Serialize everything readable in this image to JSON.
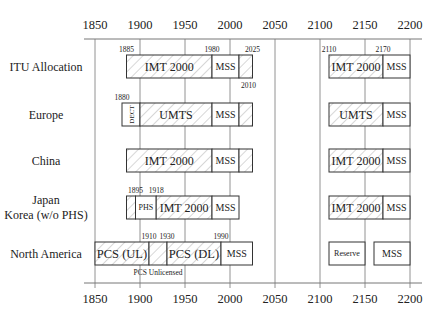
{
  "chart_data": {
    "type": "frequency-allocation-diagram",
    "title": "",
    "xlabel": "Frequency (MHz)",
    "xlim": [
      1850,
      2200
    ],
    "x_ticks": [
      1850,
      1900,
      1950,
      2000,
      2050,
      2100,
      2150,
      2200
    ],
    "grid": true,
    "rows": [
      {
        "label": [
          "ITU Allocation"
        ],
        "segments": [
          {
            "start": 1885,
            "end": 1980,
            "label": "IMT 2000",
            "hatched": true
          },
          {
            "start": 1980,
            "end": 2010,
            "label": "MSS",
            "hatched": false
          },
          {
            "start": 2010,
            "end": 2025,
            "label": "",
            "hatched": true
          },
          {
            "start": 2110,
            "end": 2170,
            "label": "IMT 2000",
            "hatched": true
          },
          {
            "start": 2170,
            "end": 2200,
            "label": "MSS",
            "hatched": false
          }
        ],
        "annotations_above": [
          {
            "value": 1885,
            "text": "1885"
          },
          {
            "value": 1980,
            "text": "1980"
          },
          {
            "value": 2025,
            "text": "2025"
          },
          {
            "value": 2110,
            "text": "2110"
          },
          {
            "value": 2170,
            "text": "2170"
          }
        ],
        "annotations_below": [
          {
            "value": 2010,
            "text": "2010"
          }
        ]
      },
      {
        "label": [
          "Europe"
        ],
        "segments": [
          {
            "start": 1880,
            "end": 1900,
            "label": "DECT",
            "hatched": false,
            "vertical": true
          },
          {
            "start": 1900,
            "end": 1980,
            "label": "UMTS",
            "hatched": true
          },
          {
            "start": 1980,
            "end": 2010,
            "label": "MSS",
            "hatched": false
          },
          {
            "start": 2010,
            "end": 2025,
            "label": "",
            "hatched": true
          },
          {
            "start": 2110,
            "end": 2170,
            "label": "UMTS",
            "hatched": true
          },
          {
            "start": 2170,
            "end": 2200,
            "label": "MSS",
            "hatched": false
          }
        ],
        "annotations_above": [
          {
            "value": 1880,
            "text": "1880"
          }
        ],
        "annotations_below": []
      },
      {
        "label": [
          "China"
        ],
        "segments": [
          {
            "start": 1885,
            "end": 1980,
            "label": "IMT 2000",
            "hatched": true
          },
          {
            "start": 1980,
            "end": 2010,
            "label": "MSS",
            "hatched": false
          },
          {
            "start": 2010,
            "end": 2025,
            "label": "",
            "hatched": true
          },
          {
            "start": 2110,
            "end": 2170,
            "label": "IMT 2000",
            "hatched": true
          },
          {
            "start": 2170,
            "end": 2200,
            "label": "MSS",
            "hatched": false
          }
        ],
        "annotations_above": [],
        "annotations_below": []
      },
      {
        "label": [
          "Japan",
          "Korea (w/o PHS)"
        ],
        "segments": [
          {
            "start": 1885,
            "end": 1895,
            "label": "",
            "hatched": true
          },
          {
            "start": 1895,
            "end": 1918,
            "label": "PHS",
            "hatched": false,
            "small": true
          },
          {
            "start": 1918,
            "end": 1980,
            "label": "IMT 2000",
            "hatched": true
          },
          {
            "start": 1980,
            "end": 2010,
            "label": "MSS",
            "hatched": false
          },
          {
            "start": 2110,
            "end": 2170,
            "label": "IMT 2000",
            "hatched": true
          },
          {
            "start": 2170,
            "end": 2200,
            "label": "MSS",
            "hatched": false
          }
        ],
        "annotations_above": [
          {
            "value": 1895,
            "text": "1895"
          },
          {
            "value": 1918,
            "text": "1918"
          }
        ],
        "annotations_below": []
      },
      {
        "label": [
          "North America"
        ],
        "segments": [
          {
            "start": 1850,
            "end": 1910,
            "label": "PCS (UL)",
            "hatched": true,
            "large": true
          },
          {
            "start": 1910,
            "end": 1930,
            "label": "",
            "hatched": true
          },
          {
            "start": 1930,
            "end": 1990,
            "label": "PCS (DL)",
            "hatched": true,
            "large": true
          },
          {
            "start": 1990,
            "end": 2025,
            "label": "MSS",
            "hatched": false
          },
          {
            "start": 2110,
            "end": 2150,
            "label": "Reserve",
            "hatched": false,
            "small": true
          },
          {
            "start": 2160,
            "end": 2200,
            "label": "MSS",
            "hatched": false
          }
        ],
        "annotations_above": [
          {
            "value": 1910,
            "text": "1910"
          },
          {
            "value": 1930,
            "text": "1930"
          },
          {
            "value": 1990,
            "text": "1990"
          }
        ],
        "annotations_below": [
          {
            "value": 1920,
            "text": "PCS Unlicensed"
          }
        ]
      }
    ]
  },
  "layout": {
    "x0_px": 95,
    "px_per_unit": 0.9,
    "axis_left_px": 84,
    "axis_right_px": 422,
    "top_axis_y": 39,
    "bottom_axis_y": 283,
    "top_label_y": 29,
    "bottom_label_y": 303,
    "row_tops": [
      55,
      103,
      149,
      196,
      242
    ],
    "row_height": 23,
    "label_center_x": 46
  },
  "colors": {
    "stroke": "#333333",
    "grid": "#777777",
    "hatch": "#9a9a9a",
    "text": "#222222"
  }
}
